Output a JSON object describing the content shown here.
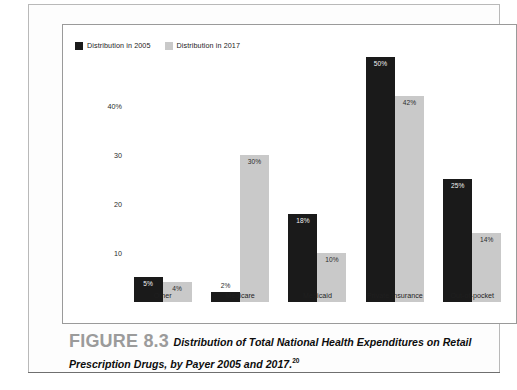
{
  "figure": {
    "number_label": "FIGURE 8.3",
    "caption_text": "Distribution of Total National Health Expenditures on Retail Prescription Drugs, by Payer 2005 and 2017.",
    "caption_superscript": "20"
  },
  "colors": {
    "series_2005": "#1a1a1a",
    "series_2017": "#c9c9c9",
    "frame": "#9a9a9a",
    "plate": "#b9b9b9",
    "figure_number": "#9b9b9b"
  },
  "legend": {
    "items": [
      {
        "label": "Distribution in 2005",
        "color": "#1a1a1a"
      },
      {
        "label": "Distribution in 2017",
        "color": "#c9c9c9"
      }
    ]
  },
  "chart_data": {
    "type": "bar",
    "title": "",
    "subtitle": "",
    "xlabel": "",
    "ylabel": "",
    "ylim": [
      0,
      52
    ],
    "grid": false,
    "legend_position": "top-left",
    "ytick_labels": [
      "40%",
      "30",
      "20",
      "10"
    ],
    "ytick_values": [
      40,
      30,
      20,
      10
    ],
    "categories": [
      "Other",
      "Medicare",
      "Medicaid",
      "Private Insurance",
      "Out-of-pocket"
    ],
    "series": [
      {
        "name": "Distribution in 2005",
        "color": "#1a1a1a",
        "values": [
          5,
          2,
          18,
          50,
          25
        ],
        "value_labels": [
          "5%",
          "2%",
          "18%",
          "50%",
          "25%"
        ]
      },
      {
        "name": "Distribution in 2017",
        "color": "#c9c9c9",
        "values": [
          4,
          30,
          10,
          42,
          14
        ],
        "value_labels": [
          "4%",
          "30%",
          "10%",
          "42%",
          "14%"
        ]
      }
    ]
  }
}
